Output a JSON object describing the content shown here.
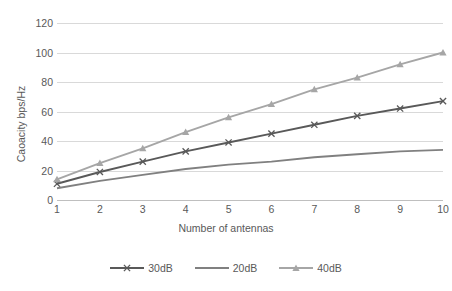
{
  "chart_data": {
    "type": "line",
    "title": "",
    "xlabel": "Number of antennas",
    "ylabel": "Caoacity bps/Hz",
    "x": [
      1,
      2,
      3,
      4,
      5,
      6,
      7,
      8,
      9,
      10
    ],
    "xticklabels": [
      "1",
      "2",
      "3",
      "4",
      "5",
      "6",
      "7",
      "8",
      "9",
      "10"
    ],
    "yticklabels": [
      "0",
      "20",
      "40",
      "60",
      "80",
      "100",
      "120"
    ],
    "yticks": [
      0,
      20,
      40,
      60,
      80,
      100,
      120
    ],
    "ylim": [
      0,
      120
    ],
    "xlim": [
      1,
      10
    ],
    "grid": "horizontal",
    "legend_position": "bottom",
    "series": [
      {
        "name": "30dB",
        "color": "#595959",
        "marker": "x",
        "values": [
          11,
          19,
          26,
          33,
          39,
          45,
          51,
          57,
          62,
          67
        ]
      },
      {
        "name": "20dB",
        "color": "#808080",
        "marker": "none",
        "values": [
          8,
          13,
          17,
          21,
          24,
          26,
          29,
          31,
          33,
          34
        ]
      },
      {
        "name": "40dB",
        "color": "#a6a6a6",
        "marker": "triangle",
        "values": [
          14,
          25,
          35,
          46,
          56,
          65,
          75,
          83,
          92,
          100
        ]
      }
    ]
  },
  "legend": {
    "items": [
      {
        "label": "30dB"
      },
      {
        "label": "20dB"
      },
      {
        "label": "40dB"
      }
    ]
  },
  "colors": {
    "gridline": "#d9d9d9",
    "axis_text": "#595959",
    "background": "#ffffff"
  }
}
